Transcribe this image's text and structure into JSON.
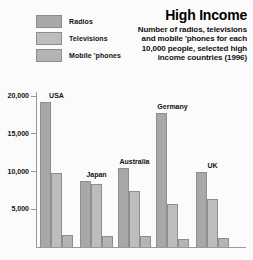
{
  "title": "High Income",
  "subtitle_lines": [
    "Number of radios, televisions",
    "and mobile 'phones for each",
    "10,000 people, selected high",
    "income countries (1996)"
  ],
  "legend": [
    {
      "label": "Radios",
      "color": "#a8a8a8"
    },
    {
      "label": "Televisions",
      "color": "#bdbdbd"
    },
    {
      "label": "Mobile 'phones",
      "color": "#b4b4b4"
    }
  ],
  "yticks": [
    {
      "label": "20,000",
      "value": 20000
    },
    {
      "label": "15,000",
      "value": 15000
    },
    {
      "label": "10,000",
      "value": 10000
    },
    {
      "label": "5,000",
      "value": 5000
    }
  ],
  "chart_data": {
    "type": "bar",
    "title": "High Income",
    "subtitle": "Number of radios, televisions and mobile 'phones for each 10,000 people, selected high income countries (1996)",
    "xlabel": "",
    "ylabel": "",
    "ylim": [
      0,
      21500
    ],
    "grid": false,
    "legend_position": "top-left",
    "categories": [
      "USA",
      "Japan",
      "Australia",
      "Germany",
      "UK"
    ],
    "series": [
      {
        "name": "Radios",
        "values": [
          19200,
          8800,
          10400,
          17800,
          10000
        ]
      },
      {
        "name": "Televisions",
        "values": [
          9800,
          8400,
          7400,
          5700,
          6400
        ]
      },
      {
        "name": "Mobile 'phones",
        "values": [
          1600,
          1500,
          1500,
          1000,
          1200
        ]
      }
    ]
  }
}
